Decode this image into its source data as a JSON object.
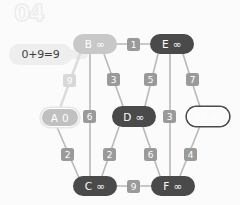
{
  "step": {
    "label": "04"
  },
  "callout": {
    "equation": "0+9=9"
  },
  "graph": {
    "nodes": [
      {
        "id": "A",
        "label": "A 0",
        "name": "node-a",
        "style": "source-ring",
        "x": 41,
        "y": 108,
        "w": 38,
        "h": 19
      },
      {
        "id": "B",
        "label": "B ∞",
        "name": "node-b",
        "style": "light",
        "x": 73,
        "y": 34,
        "w": 44,
        "h": 20
      },
      {
        "id": "C",
        "label": "C ∞",
        "name": "node-c",
        "style": "dark",
        "x": 73,
        "y": 176,
        "w": 44,
        "h": 20
      },
      {
        "id": "D",
        "label": "D ∞",
        "name": "node-d",
        "style": "dark",
        "x": 112,
        "y": 106,
        "w": 44,
        "h": 21
      },
      {
        "id": "E",
        "label": "E ∞",
        "name": "node-e",
        "style": "dark",
        "x": 150,
        "y": 34,
        "w": 44,
        "h": 20
      },
      {
        "id": "F",
        "label": "F ∞",
        "name": "node-f",
        "style": "dark",
        "x": 151,
        "y": 176,
        "w": 44,
        "h": 20
      },
      {
        "id": "G",
        "label": "G ∞",
        "name": "node-g",
        "style": "visited-ring",
        "x": 187,
        "y": 107,
        "w": 42,
        "h": 19
      }
    ],
    "edges": [
      {
        "id": "B-E",
        "from": "B",
        "to": "E",
        "weight": "1",
        "name": "edge-b-e",
        "highlight": false,
        "x1": 117,
        "y1": 44,
        "x2": 150,
        "y2": 44,
        "cx": 127,
        "cy": 38
      },
      {
        "id": "A-B",
        "from": "A",
        "to": "B",
        "weight": "9",
        "name": "edge-a-b",
        "highlight": true,
        "x1": 60,
        "y1": 108,
        "x2": 80,
        "y2": 54,
        "cx": 63,
        "cy": 74
      },
      {
        "id": "B-D",
        "from": "B",
        "to": "D",
        "weight": "3",
        "name": "edge-b-d",
        "highlight": false,
        "x1": 104,
        "y1": 54,
        "x2": 123,
        "y2": 106,
        "cx": 107,
        "cy": 73
      },
      {
        "id": "B-C",
        "from": "B",
        "to": "C",
        "weight": "6",
        "name": "edge-b-c",
        "highlight": false,
        "x1": 90,
        "y1": 54,
        "x2": 90,
        "y2": 176,
        "cx": 83,
        "cy": 110
      },
      {
        "id": "E-D",
        "from": "E",
        "to": "D",
        "weight": "5",
        "name": "edge-e-d",
        "highlight": false,
        "x1": 158,
        "y1": 54,
        "x2": 145,
        "y2": 106,
        "cx": 144,
        "cy": 73
      },
      {
        "id": "E-G",
        "from": "E",
        "to": "G",
        "weight": "7",
        "name": "edge-e-g",
        "highlight": false,
        "x1": 183,
        "y1": 54,
        "x2": 200,
        "y2": 107,
        "cx": 186,
        "cy": 73
      },
      {
        "id": "E-F",
        "from": "E",
        "to": "F",
        "weight": "3",
        "name": "edge-e-f",
        "highlight": false,
        "x1": 170,
        "y1": 54,
        "x2": 170,
        "y2": 176,
        "cx": 163,
        "cy": 110
      },
      {
        "id": "A-C",
        "from": "A",
        "to": "C",
        "weight": "2",
        "name": "edge-a-c",
        "highlight": false,
        "x1": 57,
        "y1": 127,
        "x2": 79,
        "y2": 178,
        "cx": 61,
        "cy": 148
      },
      {
        "id": "D-C",
        "from": "D",
        "to": "C",
        "weight": "2",
        "name": "edge-d-c",
        "highlight": false,
        "x1": 119,
        "y1": 127,
        "x2": 102,
        "y2": 176,
        "cx": 103,
        "cy": 148
      },
      {
        "id": "D-F",
        "from": "D",
        "to": "F",
        "weight": "6",
        "name": "edge-d-f",
        "highlight": false,
        "x1": 143,
        "y1": 127,
        "x2": 160,
        "y2": 176,
        "cx": 144,
        "cy": 148
      },
      {
        "id": "G-F",
        "from": "G",
        "to": "F",
        "weight": "4",
        "name": "edge-g-f",
        "highlight": false,
        "x1": 200,
        "y1": 126,
        "x2": 180,
        "y2": 176,
        "cx": 184,
        "cy": 148
      },
      {
        "id": "C-F",
        "from": "C",
        "to": "F",
        "weight": "9",
        "name": "edge-c-f",
        "highlight": false,
        "x1": 117,
        "y1": 186,
        "x2": 151,
        "y2": 186,
        "cx": 127,
        "cy": 180
      }
    ]
  },
  "colors": {
    "background": "#fbfbfb",
    "node_dark": "#4a4a4a",
    "node_light": "#c8c8c8",
    "chip": "#9a9a9a",
    "chip_highlight": "#d8d8d8",
    "edge": "#b9b9b9",
    "edge_highlight": "#dcdcdc",
    "callout_bg": "#eeeeee",
    "watermark": "#ececec"
  }
}
